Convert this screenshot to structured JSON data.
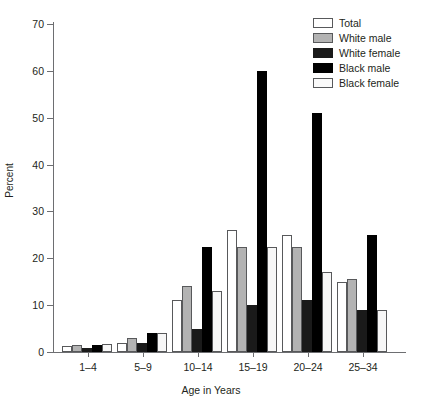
{
  "chart_data": {
    "type": "bar",
    "title": "",
    "xlabel": "Age in Years",
    "ylabel": "Percent",
    "ylim": [
      0,
      70
    ],
    "yticks": [
      0,
      10,
      20,
      30,
      40,
      50,
      60,
      70
    ],
    "grid": false,
    "legend_position": "top-right",
    "categories": [
      "1–4",
      "5–9",
      "10–14",
      "15–19",
      "20–24",
      "25–34"
    ],
    "series": [
      {
        "name": "Total",
        "color": "#ffffff",
        "values": [
          1.3,
          2.0,
          11.0,
          26.0,
          25.0,
          15.0
        ]
      },
      {
        "name": "White male",
        "color": "#b3b3b3",
        "values": [
          1.5,
          3.0,
          14.0,
          22.5,
          22.5,
          15.5
        ]
      },
      {
        "name": "White female",
        "color": "#1a1a1a",
        "values": [
          0.8,
          2.0,
          5.0,
          10.0,
          11.0,
          9.0
        ]
      },
      {
        "name": "Black male",
        "color": "#000000",
        "values": [
          1.5,
          4.0,
          22.5,
          60.0,
          51.0,
          25.0
        ]
      },
      {
        "name": "Black female",
        "color": "#f7f7f7",
        "values": [
          1.8,
          4.0,
          13.0,
          22.5,
          17.0,
          9.0
        ]
      }
    ]
  },
  "legend": {
    "items": [
      {
        "label": "Total"
      },
      {
        "label": "White male"
      },
      {
        "label": "White female"
      },
      {
        "label": "Black male"
      },
      {
        "label": "Black female"
      }
    ]
  }
}
